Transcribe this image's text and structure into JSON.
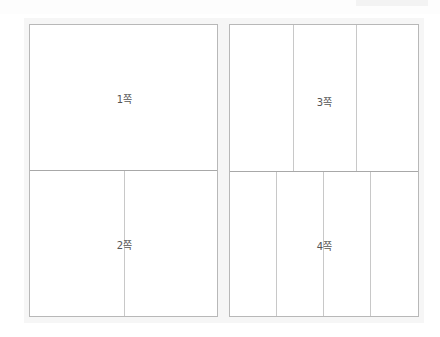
{
  "spreads": [
    {
      "id": "left",
      "pages": [
        {
          "label": "1쪽",
          "columns": 1
        },
        {
          "label": "2쪽",
          "columns": 2
        }
      ]
    },
    {
      "id": "right",
      "pages": [
        {
          "label": "3쪽",
          "columns": 3
        },
        {
          "label": "4쪽",
          "columns": 4
        }
      ]
    }
  ],
  "colors": {
    "border": "#b8b8b8",
    "column_line": "#c8c8c8",
    "label": "#555555",
    "background": "#ffffff"
  }
}
